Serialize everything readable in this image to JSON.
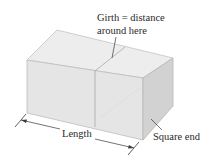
{
  "diagram": {
    "labels": {
      "girth_line1": "Girth = distance",
      "girth_line2": "around here",
      "length": "Length",
      "square_end": "Square end"
    },
    "colors": {
      "top_face": "#ececec",
      "front_face": "#e6e6e6",
      "end_face": "#d3d3d3",
      "edge": "#b8b8b8",
      "annotation": "#3a3a3a"
    }
  }
}
